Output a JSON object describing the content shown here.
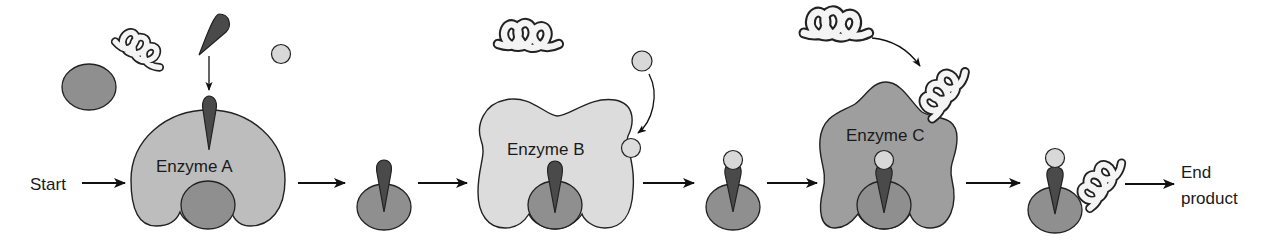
{
  "diagram": {
    "type": "metabolic-pathway",
    "start_label": "Start",
    "end_label_line1": "End",
    "end_label_line2": "product",
    "enzymes": [
      {
        "label": "Enzyme A",
        "fill": "#bdbdbd"
      },
      {
        "label": "Enzyme B",
        "fill": "#dcdcdc"
      },
      {
        "label": "Enzyme C",
        "fill": "#9e9e9e"
      }
    ],
    "colors": {
      "substrate_oval": "#8f8f8f",
      "cone": "#4a4a4a",
      "small_ball": "#d8d8d8",
      "coil": "#f4f4f4",
      "outline": "#222222",
      "arrow": "#111111"
    },
    "steps": [
      "Start",
      "Enzyme A",
      "Intermediate 1",
      "Enzyme B",
      "Intermediate 2",
      "Enzyme C",
      "Intermediate 3",
      "End product"
    ]
  }
}
